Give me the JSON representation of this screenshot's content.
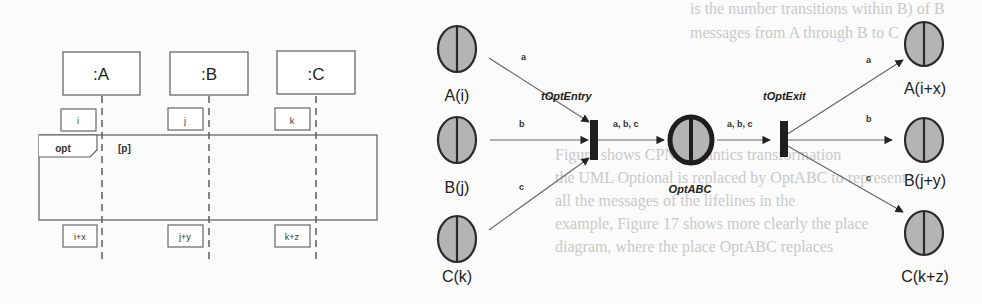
{
  "background_text": [
    "is the number transitions within B) of B",
    "messages from A through B to C",
    "Figure shows CPN semantics transformation",
    "the UML Optional is replaced by OptABC to represent",
    "all the messages of the lifelines in the",
    "example, Figure 17 shows more clearly the place",
    "diagram, where the place OptABC replaces"
  ],
  "sequence_diagram": {
    "lifelines": [
      {
        "label": ":A",
        "pre_state": "i",
        "post_state": "i+x"
      },
      {
        "label": ":B",
        "pre_state": "j",
        "post_state": "j+y"
      },
      {
        "label": ":C",
        "pre_state": "k",
        "post_state": "k+z"
      }
    ],
    "fragment": {
      "operator": "opt",
      "guard": "[p]"
    }
  },
  "petri_net": {
    "input_places": [
      {
        "label": "A(i)",
        "arc": "a"
      },
      {
        "label": "B(j)",
        "arc": "b"
      },
      {
        "label": "C(k)",
        "arc": "c"
      }
    ],
    "entry_transition": {
      "label": "tOptEntry",
      "out_arc": "a, b, c"
    },
    "central_place": {
      "label": "OptABC"
    },
    "exit_transition": {
      "label": "tOptExit",
      "in_arc": "a, b, c"
    },
    "output_places": [
      {
        "label": "A(i+x)",
        "arc": "a"
      },
      {
        "label": "B(j+y)",
        "arc": "b"
      },
      {
        "label": "C(k+z)",
        "arc": "c"
      }
    ]
  },
  "colors": {
    "place_fill": "#b4b4b4",
    "stroke": "#2a2a2a",
    "box_stroke": "#5a5a5a",
    "arc": "#666666"
  }
}
